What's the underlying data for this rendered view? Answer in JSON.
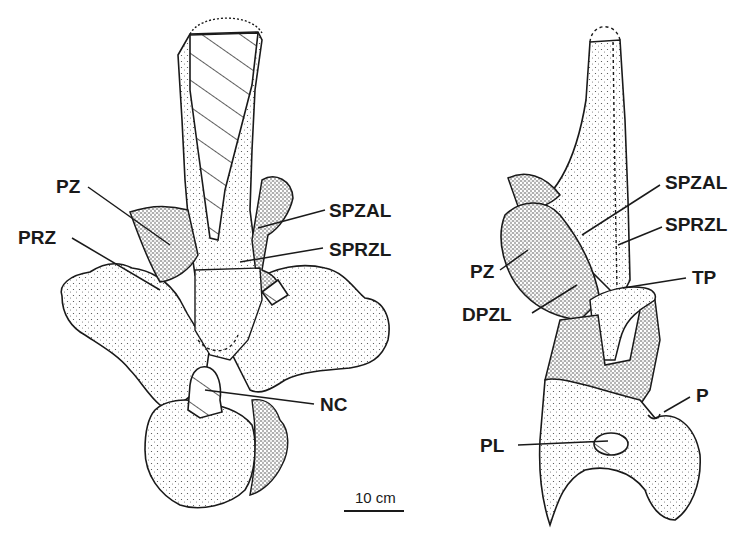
{
  "figure": {
    "left_view": {
      "labels": {
        "pz": "PZ",
        "prz": "PRZ",
        "spzal": "SPZAL",
        "sprzl": "SPRZL",
        "nc": "NC"
      }
    },
    "right_view": {
      "labels": {
        "spzal": "SPZAL",
        "sprzl": "SPRZL",
        "pz": "PZ",
        "tp": "TP",
        "dpzl": "DPZL",
        "p": "P",
        "pl": "PL"
      }
    },
    "scale_bar": {
      "label": "10 cm"
    }
  }
}
